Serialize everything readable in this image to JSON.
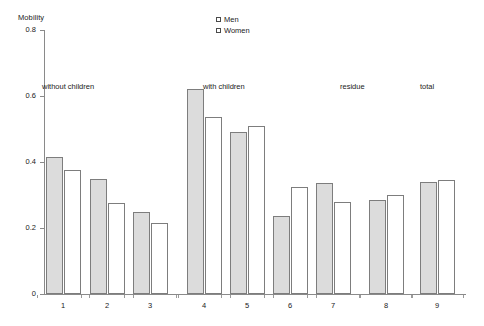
{
  "chart_data": {
    "type": "bar",
    "title": "",
    "subtitle": "",
    "xlabel": "",
    "ylabel": "Mobility",
    "ylim": [
      0,
      0.8
    ],
    "yticks": [
      "0",
      "0.2",
      "0.4",
      "0.6",
      "0.8"
    ],
    "ytick_values": [
      0,
      0.2,
      0.4,
      0.6,
      0.8
    ],
    "grid": false,
    "legend_position": "top-center",
    "categories": [
      "1",
      "2",
      "3",
      "4",
      "5",
      "6",
      "7",
      "8",
      "9"
    ],
    "series": [
      {
        "name": "Men",
        "color": "#dcdcdc",
        "values": [
          0.415,
          0.35,
          0.25,
          0.62,
          0.49,
          0.235,
          0.335,
          0.285,
          0.34
        ]
      },
      {
        "name": "Women",
        "color": "#ffffff",
        "values": [
          0.375,
          0.275,
          0.215,
          0.535,
          0.51,
          0.325,
          0.28,
          0.3,
          0.345
        ]
      }
    ],
    "annotations": [
      {
        "text": "without children",
        "categories": [
          "1",
          "2",
          "3"
        ]
      },
      {
        "text": "with children",
        "categories": [
          "4",
          "5",
          "6",
          "7"
        ]
      },
      {
        "text": "residue",
        "categories": [
          "8"
        ]
      },
      {
        "text": "total",
        "categories": [
          "9"
        ]
      }
    ]
  },
  "legend": {
    "items": [
      {
        "label": "Men"
      },
      {
        "label": "Women"
      }
    ]
  },
  "axes": {
    "y_title": "Mobility"
  }
}
